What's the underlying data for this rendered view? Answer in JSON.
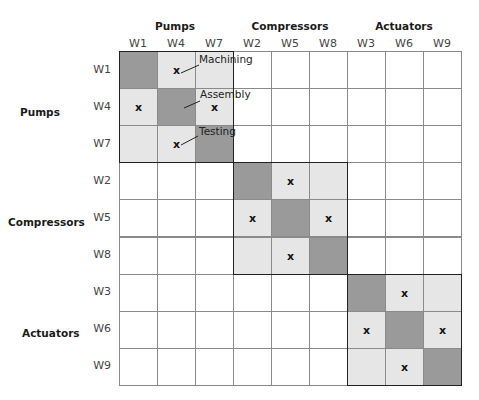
{
  "matrix": {
    "column_groups": [
      {
        "label": "Pumps",
        "x": 175
      },
      {
        "label": "Compressors",
        "x": 290
      },
      {
        "label": "Actuators",
        "x": 404
      }
    ],
    "row_groups": [
      {
        "label": "Pumps",
        "y": 113
      },
      {
        "label": "Compressors",
        "y": 223
      },
      {
        "label": "Actuators",
        "y": 334
      }
    ],
    "columns": [
      "W1",
      "W4",
      "W7",
      "W2",
      "W5",
      "W8",
      "W3",
      "W6",
      "W9"
    ],
    "rows": [
      "W1",
      "W4",
      "W7",
      "W2",
      "W5",
      "W8",
      "W3",
      "W6",
      "W9"
    ],
    "cells": [
      [
        "dark",
        "light:x",
        "light",
        "",
        "",
        "",
        "",
        "",
        ""
      ],
      [
        "light:x",
        "dark",
        "light:x",
        "",
        "",
        "",
        "",
        "",
        ""
      ],
      [
        "light",
        "light:x",
        "dark",
        "",
        "",
        "",
        "",
        "",
        ""
      ],
      [
        "",
        "",
        "",
        "dark",
        "light:x",
        "light",
        "",
        "",
        ""
      ],
      [
        "",
        "",
        "",
        "light:x",
        "dark",
        "light:x",
        "",
        "",
        ""
      ],
      [
        "",
        "",
        "",
        "light",
        "light:x",
        "dark",
        "",
        "",
        ""
      ],
      [
        "",
        "",
        "",
        "",
        "",
        "",
        "dark",
        "light:x",
        "light"
      ],
      [
        "",
        "",
        "",
        "",
        "",
        "",
        "light:x",
        "dark",
        "light:x"
      ],
      [
        "",
        "",
        "",
        "",
        "",
        "",
        "light",
        "light:x",
        "dark"
      ]
    ],
    "mark_symbol": "x",
    "annotations": [
      {
        "label": "Machining",
        "x": 199,
        "y": 60
      },
      {
        "label": "Assembly",
        "x": 200,
        "y": 95
      },
      {
        "label": "Testing",
        "x": 199,
        "y": 132
      }
    ],
    "colors": {
      "dark": "#9a9a9a",
      "light": "#e6e6e6",
      "empty": "#ffffff",
      "grid_line": "#8a8a8a",
      "block_border": "#222222"
    }
  }
}
